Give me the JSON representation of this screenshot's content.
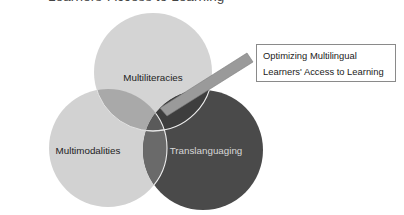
{
  "title": "Learners' Access to Learning",
  "circles": [
    {
      "id": "multiliteracies",
      "label": "Multiliteracies",
      "cx": 153,
      "cy": 72,
      "r": 59,
      "fill": "#d4d4d4",
      "label_color": "#222222",
      "label_x": 153,
      "label_y": 77
    },
    {
      "id": "multimodalities",
      "label": "Multimodalities",
      "cx": 108,
      "cy": 148,
      "r": 59,
      "fill": "#d2d2d2",
      "label_color": "#222222",
      "label_x": 88,
      "label_y": 150
    },
    {
      "id": "translanguaging",
      "label": "Translanguaging",
      "cx": 203,
      "cy": 150,
      "r": 60,
      "fill": "#4a4a4a",
      "label_color": "#d8d8d8",
      "label_x": 205,
      "label_y": 150
    }
  ],
  "callout": {
    "line1": "Optimizing Multilingual",
    "line2": "Learners' Access to Learning",
    "pointer_color": "#9a9a9a"
  },
  "colors": {
    "overlap_top_left": "#a9a9a9",
    "overlap_top_right": "#3e3e3e",
    "overlap_left_right": "#6a6a6a",
    "overlap_center": "#5a5a5a",
    "outline": "#f2f2f2"
  }
}
